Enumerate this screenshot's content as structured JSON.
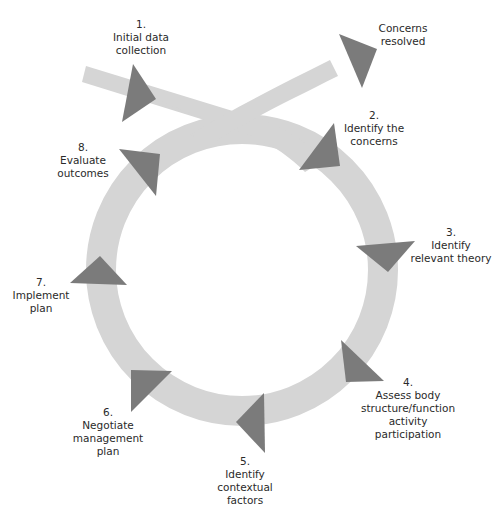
{
  "colors": {
    "band": "#d5d5d5",
    "arrow": "#7b7b7b",
    "text": "#2a2a2a",
    "background": "#ffffff"
  },
  "steps": [
    {
      "num": "1.",
      "lines": [
        "Initial data",
        "collection"
      ]
    },
    {
      "num": "2.",
      "lines": [
        "Identify the",
        "concerns"
      ]
    },
    {
      "num": "3.",
      "lines": [
        "Identify",
        "relevant theory"
      ]
    },
    {
      "num": "4.",
      "lines": [
        "Assess body",
        "structure/function",
        "activity",
        "participation"
      ]
    },
    {
      "num": "5.",
      "lines": [
        "Identify",
        "contextual",
        "factors"
      ]
    },
    {
      "num": "6.",
      "lines": [
        "Negotiate",
        "management",
        "plan"
      ]
    },
    {
      "num": "7.",
      "lines": [
        "Implement",
        "plan"
      ]
    },
    {
      "num": "8.",
      "lines": [
        "Evaluate",
        "outcomes"
      ]
    }
  ],
  "exit": {
    "lines": [
      "Concerns",
      "resolved"
    ]
  }
}
